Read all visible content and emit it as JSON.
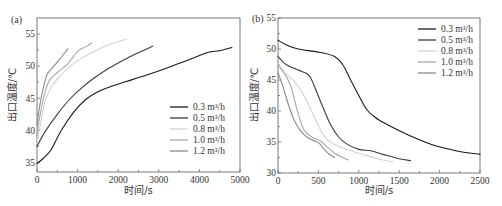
{
  "chart_data": [
    {
      "type": "line",
      "panel_label": "(a)",
      "xlabel": "时间/s",
      "ylabel": "出口温度/℃",
      "xlim": [
        0,
        5000
      ],
      "ylim": [
        33.5,
        57.5
      ],
      "xticks": [
        0,
        1000,
        2000,
        3000,
        4000,
        5000
      ],
      "yticks": [
        35,
        40,
        45,
        50,
        55
      ],
      "grid": false,
      "legend_position": "lower right",
      "series": [
        {
          "name": "0.3 m³/h",
          "color": "#1a1a1a",
          "x": [
            0,
            150,
            350,
            600,
            900,
            1200,
            1500,
            1800,
            2200,
            2700,
            3200,
            3700,
            4200,
            4500,
            4800
          ],
          "y": [
            34.8,
            35.6,
            37.0,
            40.0,
            42.8,
            44.8,
            46.0,
            46.8,
            47.6,
            48.6,
            49.7,
            50.9,
            52.1,
            52.4,
            52.9
          ]
        },
        {
          "name": "0.5 m³/h",
          "color": "#3c3c3c",
          "x": [
            0,
            200,
            500,
            800,
            1100,
            1400,
            1700,
            2000,
            2300,
            2600,
            2850
          ],
          "y": [
            37.5,
            39.8,
            42.5,
            44.8,
            46.6,
            48.1,
            49.4,
            50.5,
            51.5,
            52.4,
            53.1
          ]
        },
        {
          "name": "0.8 m³/h",
          "color": "#d3d3d3",
          "x": [
            0,
            100,
            200,
            350,
            600,
            900,
            1200,
            1500,
            1800,
            2200
          ],
          "y": [
            37.9,
            41.5,
            44.5,
            46.7,
            48.7,
            50.4,
            51.6,
            52.6,
            53.4,
            54.2
          ]
        },
        {
          "name": "1.0 m³/h",
          "color": "#a8a8a8",
          "x": [
            0,
            80,
            180,
            300,
            500,
            750,
            1000,
            1200,
            1350
          ],
          "y": [
            39.5,
            42.5,
            45.5,
            47.7,
            49.0,
            50.3,
            52.3,
            53.0,
            53.6
          ]
        },
        {
          "name": "1.2 m³/h",
          "color": "#8a8a8a",
          "x": [
            0,
            60,
            150,
            250,
            400,
            550,
            700,
            760
          ],
          "y": [
            40.8,
            43.5,
            46.5,
            48.7,
            49.9,
            51.0,
            52.2,
            52.7
          ]
        }
      ]
    },
    {
      "type": "line",
      "panel_label": "(b)",
      "xlabel": "时间/s",
      "ylabel": "出口温度/℃",
      "xlim": [
        0,
        2500
      ],
      "ylim": [
        30,
        55
      ],
      "xticks": [
        0,
        500,
        1000,
        1500,
        2000,
        2500
      ],
      "yticks": [
        30,
        35,
        40,
        45,
        50,
        55
      ],
      "grid": false,
      "legend_position": "upper right",
      "series": [
        {
          "name": "0.3 m³/h",
          "color": "#1a1a1a",
          "x": [
            0,
            100,
            250,
            500,
            700,
            800,
            900,
            1000,
            1100,
            1200,
            1350,
            1600,
            1900,
            2200,
            2500
          ],
          "y": [
            51.4,
            50.7,
            50.0,
            49.5,
            48.8,
            47.5,
            45.0,
            42.5,
            40.2,
            39.0,
            37.8,
            36.2,
            34.6,
            33.6,
            33.0
          ]
        },
        {
          "name": "0.5 m³/h",
          "color": "#3c3c3c",
          "x": [
            0,
            100,
            250,
            380,
            450,
            550,
            650,
            750,
            850,
            1000,
            1150,
            1300,
            1500,
            1640
          ],
          "y": [
            48.8,
            47.5,
            46.6,
            45.8,
            44.0,
            40.8,
            37.8,
            35.8,
            34.7,
            33.8,
            33.6,
            33.0,
            32.3,
            32.0
          ]
        },
        {
          "name": "0.8 m³/h",
          "color": "#d3d3d3",
          "x": [
            0,
            100,
            200,
            300,
            400,
            500,
            600,
            750,
            900,
            1100,
            1300,
            1430
          ],
          "y": [
            47.7,
            46.0,
            44.8,
            43.0,
            40.5,
            37.6,
            35.5,
            34.3,
            33.6,
            32.8,
            32.1,
            31.8
          ]
        },
        {
          "name": "1.0 m³/h",
          "color": "#a8a8a8",
          "x": [
            0,
            80,
            160,
            240,
            320,
            420,
            520,
            600,
            700,
            800,
            870
          ],
          "y": [
            47.4,
            46.0,
            44.0,
            40.0,
            37.0,
            35.8,
            35.2,
            34.3,
            33.2,
            32.5,
            32.1
          ]
        },
        {
          "name": "1.2 m³/h",
          "color": "#8a8a8a",
          "x": [
            0,
            60,
            130,
            200,
            280,
            380,
            500,
            560,
            620,
            700
          ],
          "y": [
            46.2,
            44.0,
            41.0,
            38.5,
            36.8,
            35.6,
            34.9,
            34.0,
            33.2,
            32.5
          ]
        }
      ]
    }
  ],
  "panels": [
    {
      "label": "(a)",
      "xlabel": "时间/s",
      "ylabel": "出口温度/℃",
      "legend": [
        "0.3 m³/h",
        "0.5 m³/h",
        "0.8 m³/h",
        "1.0 m³/h",
        "1.2 m³/h"
      ]
    },
    {
      "label": "(b)",
      "xlabel": "时间/s",
      "ylabel": "出口温度/℃",
      "legend": [
        "0.3 m³/h",
        "0.5 m³/h",
        "0.8 m³/h",
        "1.0 m³/h",
        "1.2 m³/h"
      ]
    }
  ]
}
